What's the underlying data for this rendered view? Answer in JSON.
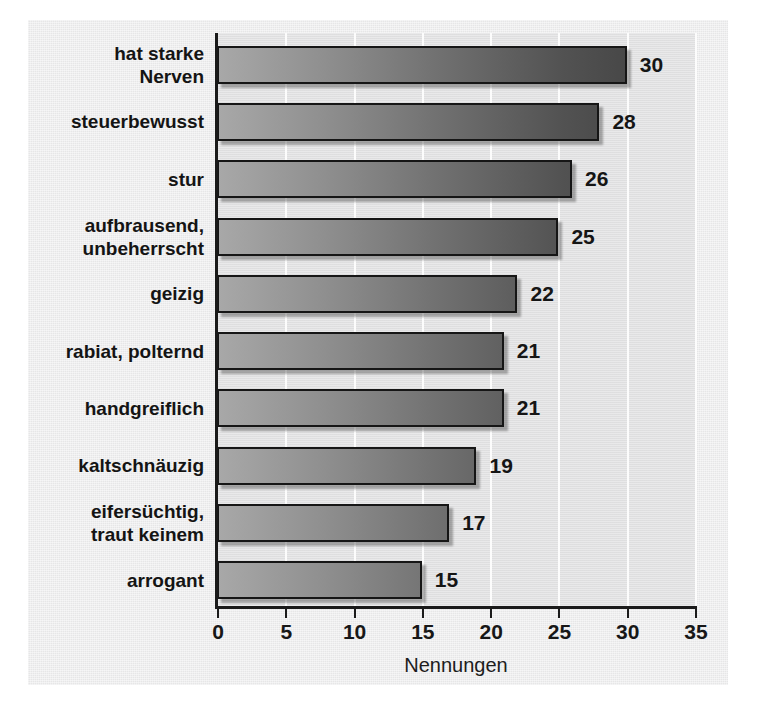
{
  "chart_data": {
    "type": "bar",
    "orientation": "horizontal",
    "title": "",
    "subtitle": "",
    "xlabel": "Nennungen",
    "ylabel": "",
    "xlim": [
      0,
      35
    ],
    "xticks": [
      0,
      5,
      10,
      15,
      20,
      25,
      30,
      35
    ],
    "xtick_labels": [
      "0",
      "5",
      "10",
      "15",
      "20",
      "25",
      "30",
      "35"
    ],
    "grid": "vertical-white-gridlines-at-xticks",
    "legend": "none",
    "categories": [
      "hat starke\nNerven",
      "steuerbewusst",
      "stur",
      "aufbrausend,\nunbeherrscht",
      "geizig",
      "rabiat, polternd",
      "handgreiflich",
      "kaltschnäuzig",
      "eifersüchtig,\ntraut keinem",
      "arrogant"
    ],
    "values": [
      30,
      28,
      26,
      25,
      22,
      21,
      21,
      19,
      17,
      15
    ],
    "value_labels": [
      "30",
      "28",
      "26",
      "25",
      "22",
      "21",
      "21",
      "19",
      "17",
      "15"
    ],
    "bars": [
      {
        "category": "hat starke\nNerven",
        "value": 30,
        "label": "30"
      },
      {
        "category": "steuerbewusst",
        "value": 28,
        "label": "28"
      },
      {
        "category": "stur",
        "value": 26,
        "label": "26"
      },
      {
        "category": "aufbrausend,\nunbeherrscht",
        "value": 25,
        "label": "25"
      },
      {
        "category": "geizig",
        "value": 22,
        "label": "22"
      },
      {
        "category": "rabiat, polternd",
        "value": 21,
        "label": "21"
      },
      {
        "category": "handgreiflich",
        "value": 21,
        "label": "21"
      },
      {
        "category": "kaltschnäuzig",
        "value": 19,
        "label": "19"
      },
      {
        "category": "eifersüchtig,\ntraut keinem",
        "value": 17,
        "label": "17"
      },
      {
        "category": "arrogant",
        "value": 15,
        "label": "15"
      }
    ]
  },
  "colors": {
    "figure_background": "#ececed",
    "plot_background": "#e2e2e3",
    "gridline": "#fcfcfc",
    "axis": "#1a1a1a",
    "bar_gradient_light": "#a8a8a8",
    "bar_gradient_dark": "#3c3c3c",
    "bar_border": "#161616",
    "text": "#141414"
  }
}
